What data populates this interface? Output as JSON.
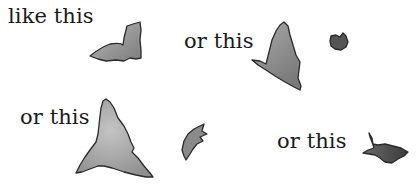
{
  "illustration": {
    "labels": [
      {
        "text": "like this",
        "x": 8,
        "y": 6
      },
      {
        "text": "or this",
        "x": 184,
        "y": 31
      },
      {
        "text": "or this",
        "x": 20,
        "y": 107
      },
      {
        "text": "or this",
        "x": 277,
        "y": 131
      }
    ],
    "shapes": [
      {
        "name": "leaf-shape-1",
        "fill": "#9a9a9a"
      },
      {
        "name": "leaf-shape-2",
        "fill": "#8f8f8f"
      },
      {
        "name": "leaf-shape-3",
        "fill": "#555555"
      },
      {
        "name": "leaf-shape-4",
        "fill": "#a3a3a3"
      },
      {
        "name": "leaf-shape-5",
        "fill": "#8a8a8a"
      },
      {
        "name": "leaf-shape-6",
        "fill": "#4a4a4a"
      }
    ]
  }
}
